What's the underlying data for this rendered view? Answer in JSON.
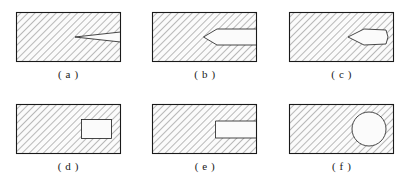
{
  "figure": {
    "caption_prefix": "(",
    "caption_suffix": ")",
    "background_color": "#ffffff",
    "outline_color": "#1a1a1a",
    "hatch_color": "#4a4a4a",
    "void_fill_color": "#fbfbfb",
    "hatch_angle_deg": 45,
    "hatch_spacing_px": 5,
    "panels": [
      {
        "id": "a",
        "caption": "( a )",
        "label": "a",
        "shape_name": "thin-v-notch-right-edge",
        "description": "Rectangular hatched section with a thin V-shaped notch cut inward from the right edge",
        "void_type": "open-notch"
      },
      {
        "id": "b",
        "caption": "( b )",
        "label": "b",
        "shape_name": "keyhole-slot-pointed-tip",
        "description": "Rectangular hatched section with a parallel-sided slot from the right edge ending in a pointed V tip",
        "void_type": "open-notch"
      },
      {
        "id": "c",
        "caption": "( c )",
        "label": "c",
        "shape_name": "internal-lens-leaf-void",
        "description": "Rectangular hatched section with an internal lens/leaf shaped void near the right edge pointing left",
        "void_type": "internal"
      },
      {
        "id": "d",
        "caption": "( d )",
        "label": "d",
        "shape_name": "internal-rectangular-hole",
        "description": "Rectangular hatched section with an enclosed rectangular hole offset toward the right",
        "void_type": "internal"
      },
      {
        "id": "e",
        "caption": "( e )",
        "label": "e",
        "shape_name": "open-rectangular-slot",
        "description": "Rectangular hatched section with a rectangular slot open through the right edge",
        "void_type": "open-notch"
      },
      {
        "id": "f",
        "caption": "( f )",
        "label": "f",
        "shape_name": "internal-circular-hole",
        "description": "Rectangular hatched section with an enclosed circular hole near the right edge",
        "void_type": "internal"
      }
    ]
  }
}
